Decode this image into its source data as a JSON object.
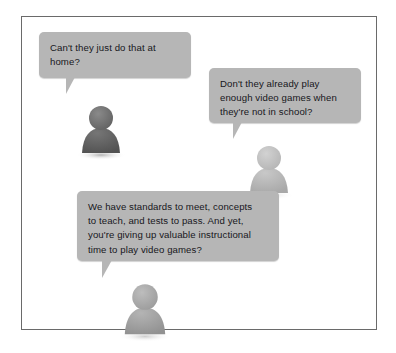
{
  "scene": {
    "title": "Teacher objections speech bubble illustration",
    "background_color": "#ffffff",
    "frame_border_color": "#6a6a6a",
    "bubble_fill_color": "#b6b6b6",
    "text_color": "#16171c"
  },
  "bubbles": [
    {
      "id": "bubble-1",
      "text": "Can't they just do that at\nhome?",
      "speaker": "person-1"
    },
    {
      "id": "bubble-2",
      "text": "Don't they already play\nenough video games when\nthey're not in school?",
      "speaker": "person-2"
    },
    {
      "id": "bubble-3",
      "text": "We have standards to meet, concepts\nto teach, and tests to pass. And yet,\nyou're giving up valuable instructional\ntime to play video games?",
      "speaker": "person-3"
    }
  ],
  "avatars": [
    {
      "id": "avatar-1",
      "label": "person-1",
      "head_color": "#6f6f6f",
      "body_color": "#5c5c5c"
    },
    {
      "id": "avatar-2",
      "label": "person-2",
      "head_color": "#c2c2c2",
      "body_color": "#b3b3b3"
    },
    {
      "id": "avatar-3",
      "label": "person-3",
      "head_color": "#a9a9a9",
      "body_color": "#9b9b9b"
    }
  ]
}
